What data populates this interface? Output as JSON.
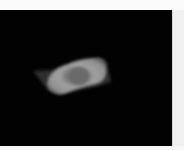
{
  "image": {
    "description": "Grayscale microscopy-style image: bright irregular elongated blob with darker center on black background",
    "background_color": "#020202",
    "object_color": "#9a9a9a",
    "center_color": "#6e6e6e",
    "border_color": "#f4f4f4"
  }
}
